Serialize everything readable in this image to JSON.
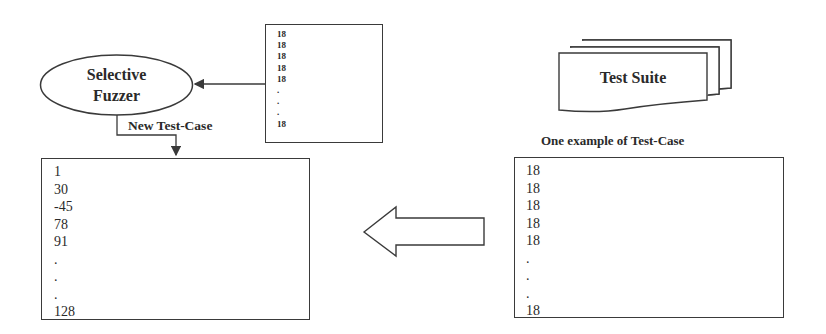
{
  "diagram": {
    "fuzzer": {
      "line1": "Selective",
      "line2": "Fuzzer"
    },
    "edge_label": "New Test-Case",
    "test_suite": {
      "label": "Test Suite"
    },
    "example_caption": "One example of Test-Case",
    "input_box_small": {
      "lines": [
        "18",
        "18",
        "18",
        "18",
        "18",
        ".",
        ".",
        ".",
        "18"
      ]
    },
    "output_box": {
      "lines": [
        "1",
        "30",
        "-45",
        "78",
        "91",
        ".",
        ".",
        ".",
        "128"
      ]
    },
    "example_box": {
      "lines": [
        "18",
        "18",
        "18",
        "18",
        "18",
        ".",
        ".",
        ".",
        "18"
      ]
    },
    "colors": {
      "stroke": "#3a3a3a",
      "background": "#ffffff",
      "text": "#2a2a2a"
    }
  }
}
